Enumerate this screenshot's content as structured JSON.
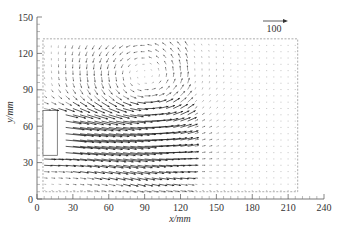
{
  "chart_data": {
    "type": "vector-field",
    "title": "",
    "xlabel": "x/mm",
    "ylabel": "y/mm",
    "xlim": [
      0,
      240
    ],
    "ylim": [
      0,
      150
    ],
    "x_ticks": [
      0,
      30,
      60,
      90,
      120,
      150,
      180,
      210,
      240
    ],
    "y_ticks": [
      0,
      30,
      60,
      90,
      120,
      150
    ],
    "grid": false,
    "reference_vector": {
      "label": "100",
      "magnitude": 100
    },
    "measurement_region": {
      "x": [
        5,
        218
      ],
      "y": [
        6,
        132
      ],
      "style": "dashed"
    },
    "inlet": {
      "x": [
        5,
        17
      ],
      "y": [
        36,
        73
      ]
    },
    "vector_grid": {
      "x_start": 6,
      "x_step": 6,
      "x_count": 36,
      "y_start": 7,
      "y_step": 5.2,
      "y_count": 25
    },
    "flow_description": "Wall jet issuing from inlet (x≈5–17 mm, y≈36–73 mm) flowing in +x; strong core velocities between y≈25–70 mm up to x≈110 mm; counter-clockwise recirculation vortex above the jet (centre ≈ x 90, y 95); lower jet region deflects downward toward the floor near x≈60–100 mm; far field (x>130 mm) nearly quiescent.",
    "jet_core": {
      "y_center": 50,
      "half_width": 22,
      "peak_velocity": 100,
      "decay_x": 115
    },
    "vortex": {
      "center_x": 90,
      "center_y": 97,
      "strength": 35
    }
  },
  "axes": {
    "y_tick_labels": [
      "0",
      "30",
      "60",
      "90",
      "120",
      "150"
    ],
    "x_tick_labels": [
      "0",
      "30",
      "60",
      "90",
      "120",
      "150",
      "180",
      "210",
      "240"
    ],
    "xlabel": "x/mm",
    "ylabel": "y/mm"
  },
  "legend": {
    "ref_label": "100"
  }
}
